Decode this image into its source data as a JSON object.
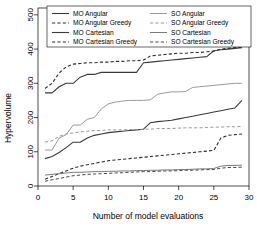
{
  "chart_data": {
    "type": "line",
    "title": "",
    "xlabel": "Number of model evaluations",
    "ylabel": "Hypervolume",
    "xlim": [
      0,
      30
    ],
    "ylim": [
      0,
      520
    ],
    "xticks": [
      0,
      5,
      10,
      15,
      20,
      25,
      30
    ],
    "yticks": [
      0,
      100,
      200,
      300,
      400,
      500
    ],
    "xtick_labels": [
      "0",
      "5",
      "10",
      "15",
      "20",
      "25",
      "30"
    ],
    "ytick_labels": [
      "0",
      "100",
      "200",
      "300",
      "400",
      "500"
    ],
    "grid": false,
    "legend_position": "top",
    "legend_columns": 2,
    "series": [
      {
        "name": "MO Angular",
        "color": "#3a3a3a",
        "dash": "solid",
        "width": 1.1,
        "x": [
          1,
          2,
          3,
          4,
          5,
          6,
          7,
          8,
          9,
          10,
          11,
          12,
          13,
          14,
          15,
          16,
          17,
          18,
          19,
          20,
          21,
          22,
          23,
          24,
          25,
          26,
          27,
          28,
          29
        ],
        "values": [
          272,
          272,
          290,
          300,
          300,
          318,
          326,
          326,
          332,
          332,
          332,
          332,
          332,
          332,
          360,
          362,
          364,
          366,
          368,
          370,
          372,
          374,
          376,
          378,
          395,
          398,
          400,
          402,
          404
        ]
      },
      {
        "name": "MO Angular Greedy",
        "color": "#2e2e2e",
        "dash": "dashed",
        "width": 1.1,
        "x": [
          1,
          2,
          3,
          4,
          5,
          6,
          7,
          8,
          9,
          10,
          11,
          12,
          13,
          14,
          15,
          16,
          17,
          18,
          19,
          20,
          21,
          22,
          23,
          24,
          25,
          26,
          27,
          28,
          29
        ],
        "values": [
          285,
          300,
          330,
          348,
          356,
          358,
          360,
          360,
          362,
          362,
          364,
          364,
          366,
          366,
          368,
          380,
          382,
          384,
          386,
          388,
          388,
          390,
          390,
          392,
          394,
          400,
          402,
          404,
          406
        ]
      },
      {
        "name": "MO Cartesian",
        "color": "#3a3a3a",
        "dash": "solid",
        "width": 1.1,
        "x": [
          1,
          2,
          3,
          4,
          5,
          6,
          7,
          8,
          9,
          10,
          11,
          12,
          13,
          14,
          15,
          16,
          17,
          18,
          19,
          20,
          21,
          22,
          23,
          24,
          25,
          26,
          27,
          28,
          29
        ],
        "values": [
          80,
          86,
          98,
          112,
          128,
          128,
          140,
          148,
          152,
          156,
          158,
          160,
          162,
          164,
          166,
          185,
          188,
          190,
          192,
          196,
          200,
          204,
          208,
          212,
          216,
          220,
          224,
          228,
          250
        ]
      },
      {
        "name": "MO Cartesian Greedy",
        "color": "#2e2e2e",
        "dash": "dashed",
        "width": 1.1,
        "x": [
          1,
          2,
          3,
          4,
          5,
          6,
          7,
          8,
          9,
          10,
          11,
          12,
          13,
          14,
          15,
          16,
          17,
          18,
          19,
          20,
          21,
          22,
          23,
          24,
          25,
          26,
          27,
          28,
          29
        ],
        "values": [
          20,
          28,
          36,
          44,
          52,
          58,
          62,
          66,
          70,
          74,
          76,
          78,
          80,
          82,
          84,
          86,
          88,
          90,
          92,
          94,
          96,
          98,
          100,
          102,
          104,
          140,
          148,
          150,
          152
        ]
      },
      {
        "name": "SO Angular",
        "color": "#9a9a9a",
        "dash": "solid",
        "width": 1.0,
        "x": [
          1,
          2,
          3,
          4,
          5,
          6,
          7,
          8,
          9,
          10,
          11,
          12,
          13,
          14,
          15,
          16,
          17,
          18,
          19,
          20,
          21,
          22,
          23,
          24,
          25,
          26,
          27,
          28,
          29
        ],
        "values": [
          105,
          105,
          140,
          150,
          178,
          178,
          195,
          200,
          225,
          240,
          245,
          248,
          250,
          250,
          250,
          252,
          268,
          272,
          275,
          275,
          276,
          288,
          290,
          292,
          294,
          296,
          298,
          300,
          300
        ]
      },
      {
        "name": "SO Angular Greedy",
        "color": "#9a9a9a",
        "dash": "dashed",
        "width": 1.0,
        "x": [
          1,
          2,
          3,
          4,
          5,
          6,
          7,
          8,
          9,
          10,
          11,
          12,
          13,
          14,
          15,
          16,
          17,
          18,
          19,
          20,
          21,
          22,
          23,
          24,
          25,
          26,
          27,
          28,
          29
        ],
        "values": [
          128,
          132,
          145,
          152,
          155,
          158,
          160,
          162,
          162,
          164,
          164,
          164,
          165,
          165,
          166,
          166,
          168,
          168,
          168,
          169,
          170,
          170,
          170,
          171,
          172,
          172,
          173,
          173,
          174
        ]
      },
      {
        "name": "SO Cartesian",
        "color": "#7a7a7a",
        "dash": "solid",
        "width": 1.0,
        "x": [
          1,
          2,
          3,
          4,
          5,
          6,
          7,
          8,
          9,
          10,
          11,
          12,
          13,
          14,
          15,
          16,
          17,
          18,
          19,
          20,
          21,
          22,
          23,
          24,
          25,
          26,
          27,
          28,
          29
        ],
        "values": [
          32,
          34,
          36,
          38,
          40,
          40,
          41,
          42,
          42,
          43,
          43,
          44,
          44,
          45,
          45,
          46,
          46,
          47,
          47,
          48,
          48,
          49,
          50,
          50,
          51,
          58,
          60,
          60,
          61
        ]
      },
      {
        "name": "SO Cartesian Greedy",
        "color": "#4a4a4a",
        "dash": "dashed",
        "width": 1.0,
        "x": [
          1,
          2,
          3,
          4,
          5,
          6,
          7,
          8,
          9,
          10,
          11,
          12,
          13,
          14,
          15,
          16,
          17,
          18,
          19,
          20,
          21,
          22,
          23,
          24,
          25,
          26,
          27,
          28,
          29
        ],
        "values": [
          14,
          18,
          22,
          26,
          30,
          32,
          34,
          35,
          36,
          37,
          38,
          39,
          40,
          41,
          42,
          42,
          43,
          44,
          44,
          45,
          46,
          46,
          47,
          48,
          48,
          52,
          54,
          54,
          55
        ]
      }
    ],
    "legend_entries": [
      {
        "label": "MO Angular",
        "column": 0
      },
      {
        "label": "MO Angular Greedy",
        "column": 0
      },
      {
        "label": "MO Cartesian",
        "column": 0
      },
      {
        "label": "MO Cartesian Greedy",
        "column": 0
      },
      {
        "label": "SO Angular",
        "column": 1
      },
      {
        "label": "SO Angular Greedy",
        "column": 1
      },
      {
        "label": "SO Cartesian",
        "column": 1
      },
      {
        "label": "SO Cartesian Greedy",
        "column": 1
      }
    ]
  }
}
